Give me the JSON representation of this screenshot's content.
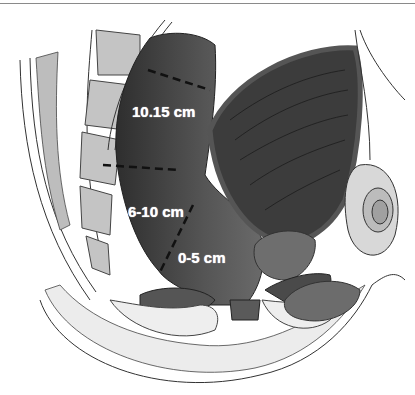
{
  "figure": {
    "labels": {
      "upper": "10.15 cm",
      "middle": "6-10 cm",
      "lower": "0-5 cm"
    },
    "colors": {
      "rectum": "#4a4a4a",
      "bladder": "#3a3a3a",
      "bone": "#cfcfcf",
      "outline": "#2a2a2a",
      "label": "#ffffff"
    }
  }
}
